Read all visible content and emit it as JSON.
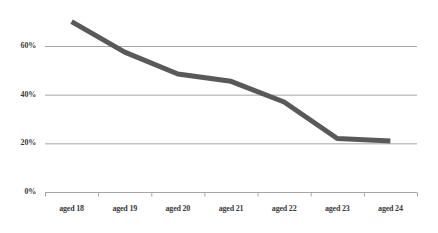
{
  "chart_data": {
    "type": "line",
    "title": "",
    "subtitle": "",
    "xlabel": "",
    "ylabel": "",
    "categories": [
      "aged 18",
      "aged 19",
      "aged 20",
      "aged 21",
      "aged 22",
      "aged 23",
      "aged 24"
    ],
    "series": [
      {
        "name": "",
        "values": [
          70,
          57.5,
          48.5,
          45.5,
          37,
          22,
          21
        ],
        "color": "#595959",
        "line_width": 5
      }
    ],
    "ylim": [
      0,
      70
    ],
    "y_ticks": [
      0,
      20,
      40,
      60
    ],
    "y_tick_labels": [
      "0%",
      "20%",
      "40%",
      "60%"
    ],
    "grid": true,
    "grid_axis": "y",
    "grid_color": "#a6a6a6",
    "legend": false,
    "legend_position": "none",
    "axis_line_color": "#a6a6a6",
    "tick_mark_color": "#a6a6a6",
    "background": "#ffffff",
    "text_color": "#3b3b3b"
  }
}
